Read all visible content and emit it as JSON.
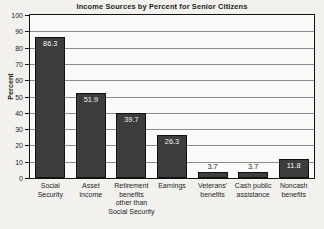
{
  "chart_data": {
    "type": "bar",
    "title": "Income Sources by Percent for Senior Citizens",
    "xlabel": "",
    "ylabel": "Percent",
    "ylim": [
      0,
      100
    ],
    "ytick_step": 10,
    "yticks": [
      "100",
      "90",
      "80",
      "70",
      "60",
      "50",
      "40",
      "30",
      "20",
      "10",
      "0"
    ],
    "grid": true,
    "legend": "none",
    "categories": [
      "Social Security",
      "Asset income",
      "Retirement benefits other than Social Security",
      "Earnings",
      "Veterans' benefits",
      "Cash public assistance",
      "Noncash benefits"
    ],
    "category_label_lines": [
      [
        "Social",
        "Security"
      ],
      [
        "Asset",
        "income"
      ],
      [
        "Retirement",
        "benefits",
        "other than",
        "Social Security"
      ],
      [
        "Earnings"
      ],
      [
        "Veterans'",
        "benefits"
      ],
      [
        "Cash public",
        "assistance"
      ],
      [
        "Noncash",
        "benefits"
      ]
    ],
    "values": [
      86.3,
      51.9,
      39.7,
      26.3,
      3.7,
      3.7,
      11.8
    ],
    "value_labels": [
      "86.3",
      "51.9",
      "39.7",
      "26.3",
      "3.7",
      "3.7",
      "11.8"
    ],
    "bar_color": "#3d3d3d",
    "bar_border_color": "#111111",
    "plot_background": "#fbfaf8",
    "gridline_color": "#8d8d8d",
    "page_background": "#f2f1ee",
    "text_color": "#1d1d1d"
  }
}
